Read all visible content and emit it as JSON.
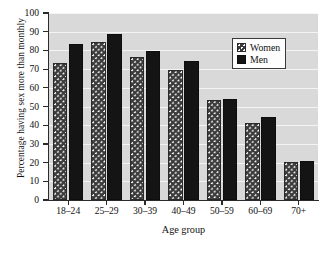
{
  "chart_data": {
    "type": "bar",
    "title": "",
    "xlabel": "Age group",
    "ylabel": "Percentage having sex more than monthly",
    "categories": [
      "18–24",
      "25–29",
      "30–39",
      "40–49",
      "50–59",
      "60–69",
      "70+"
    ],
    "series": [
      {
        "name": "Women",
        "values": [
          73,
          84.5,
          76.5,
          69.5,
          53.5,
          41,
          20.5
        ]
      },
      {
        "name": "Men",
        "values": [
          83.5,
          89,
          79.5,
          74.5,
          54,
          44.5,
          21
        ]
      }
    ],
    "ylim": [
      0,
      100
    ],
    "yticks": [
      0,
      10,
      20,
      30,
      40,
      50,
      60,
      70,
      80,
      90,
      100
    ],
    "ytick_labels": [
      "0",
      "10",
      "20",
      "30",
      "40",
      "50",
      "60",
      "70",
      "80",
      "90",
      "100"
    ],
    "grid": true,
    "grid_axis": "y",
    "legend_position": "upper right",
    "plot_background": "#d9d9d9",
    "gridline_color": "#f4f4f4",
    "series_colors": [
      "#3b3b3b",
      "#141414"
    ]
  },
  "legend": {
    "entries": [
      {
        "label": "Women",
        "swatch": "women-pattern-swatch"
      },
      {
        "label": "Men",
        "swatch": "men-solid-swatch"
      }
    ]
  }
}
